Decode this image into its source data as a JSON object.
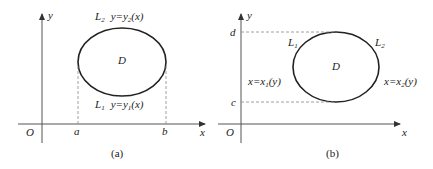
{
  "panels": [
    {
      "id": "a",
      "caption": "(a)",
      "origin_label": "O",
      "x_axis_label": "x",
      "y_axis_label": "y",
      "region_label": "D",
      "upper_curve": {
        "name": "L",
        "sub": "2",
        "eq_lhs": "y=y",
        "eq_sub": "2",
        "eq_arg": "(x)"
      },
      "lower_curve": {
        "name": "L",
        "sub": "1",
        "eq_lhs": "y=y",
        "eq_sub": "1",
        "eq_arg": "(x)"
      },
      "bound_left": "a",
      "bound_right": "b"
    },
    {
      "id": "b",
      "caption": "(b)",
      "origin_label": "O",
      "x_axis_label": "x",
      "y_axis_label": "y",
      "region_label": "D",
      "left_curve": {
        "name": "L",
        "sub": "1",
        "eq_lhs": "x=x",
        "eq_sub": "1",
        "eq_arg": "(y)"
      },
      "right_curve": {
        "name": "L",
        "sub": "2",
        "eq_lhs": "x=x",
        "eq_sub": "2",
        "eq_arg": "(y)"
      },
      "bound_top": "d",
      "bound_bottom": "c"
    }
  ],
  "colors": {
    "stroke": "#222222",
    "dash": "#888888",
    "axis": "#555555"
  }
}
